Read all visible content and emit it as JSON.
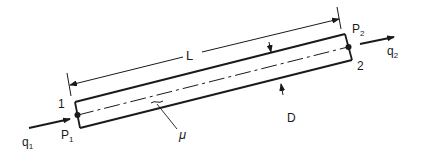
{
  "diagram": {
    "labels": {
      "length": "L",
      "diameter": "D",
      "viscosity": "μ",
      "inlet_node": "1",
      "outlet_node": "2",
      "inlet_pressure": "P",
      "inlet_pressure_sub": "1",
      "outlet_pressure": "P",
      "outlet_pressure_sub": "2",
      "inlet_flow": "q",
      "inlet_flow_sub": "1",
      "outlet_flow": "q",
      "outlet_flow_sub": "2"
    },
    "colors": {
      "stroke": "#1a1a1a",
      "background": "#ffffff"
    }
  }
}
